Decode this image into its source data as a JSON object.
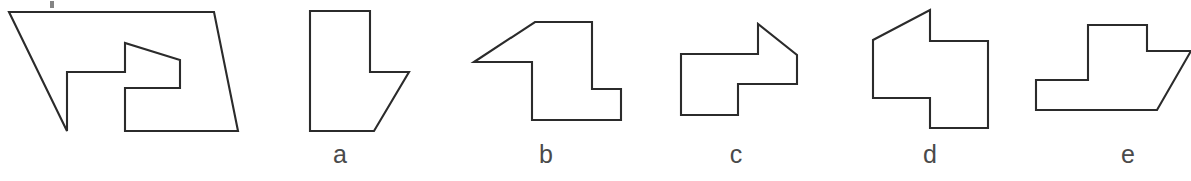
{
  "figure": {
    "type": "geometry-puzzle",
    "background_color": "#ffffff",
    "line_color": "#2b2b2b",
    "label_color": "#4a4a4a",
    "stroke_width": 2.1
  },
  "prompt_figure": {
    "name": "parallelogram-with-arrow-cutout",
    "outer_points": "9,12 214,12 238,131 67,131 67,70 9,12",
    "outer_points_note": "parallelogram with a notch cut from the lower-left interior",
    "hole_points": "125,43 125,72 67,72 67,131 238,131 214,12",
    "outline_path": "M 9,12 L 214,12 L 238,131 L 125,131 L 125,88 L 180,88 L 180,60 L 125,43 L 125,72 L 67,72 L 67,131 Z"
  },
  "shapes": [
    {
      "id": "a",
      "label": "a",
      "name": "option-a-shape",
      "points": "310,11 370,11 370,72 409,72 374,131 310,131",
      "label_x": 340,
      "label_y": 148
    },
    {
      "id": "b",
      "label": "b",
      "name": "option-b-shape",
      "points": "474,62 535,22 592,22 592,89 621,89 621,120 532,120 532,62",
      "label_x": 546,
      "label_y": 148
    },
    {
      "id": "c",
      "label": "c",
      "name": "option-c-shape",
      "points": "681,54 758,54 758,24 797,55 797,84 738,84 738,115 681,115",
      "label_x": 736,
      "label_y": 148
    },
    {
      "id": "d",
      "label": "d",
      "name": "option-d-shape",
      "points": "873,40 930,10 930,41 988,41 988,128 930,128 930,98 873,98",
      "label_x": 930,
      "label_y": 148
    },
    {
      "id": "e",
      "label": "e",
      "name": "option-e-shape",
      "points": "1088,25 1147,25 1147,51 1191,51 1157,110 1036,110 1036,80 1088,80",
      "label_x": 1128,
      "label_y": 148
    }
  ],
  "labels": {
    "a": "a",
    "b": "b",
    "c": "c",
    "d": "d",
    "e": "e"
  },
  "artifacts": [
    {
      "name": "top-speck-mark",
      "x": 50,
      "y": 1
    }
  ]
}
